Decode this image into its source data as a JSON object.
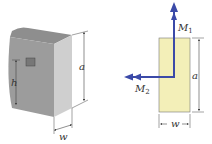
{
  "figure": {
    "left": {
      "labels": {
        "height": "h",
        "depth": "a",
        "width": "w"
      }
    },
    "right": {
      "moments": [
        {
          "name": "M",
          "sub": "1",
          "direction": "up"
        },
        {
          "name": "M",
          "sub": "2",
          "direction": "left"
        }
      ],
      "labels": {
        "height": "a",
        "width": "w"
      }
    },
    "colors": {
      "block_top": "#8a8a8a",
      "block_side": "#9a9a9a",
      "block_front": "#c8c8c8",
      "window": "#7a7a7a",
      "section_fill": "#f3efb8",
      "arrow": "#3b4aa8",
      "dim_line": "#444444"
    }
  }
}
